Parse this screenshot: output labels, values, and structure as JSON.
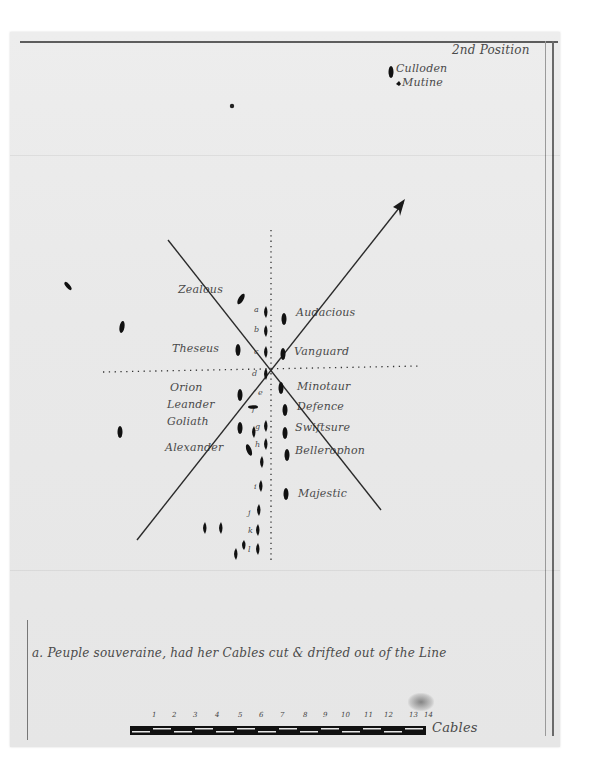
{
  "document": {
    "title": "2nd Position",
    "type": "naval battle plan manuscript"
  },
  "outlying_ships": [
    {
      "label": "Culloden"
    },
    {
      "label": "Mutine"
    }
  ],
  "port_column_labels": [
    {
      "label": "Zealous"
    },
    {
      "label": "Theseus"
    },
    {
      "label": "Orion"
    },
    {
      "label": "Leander"
    },
    {
      "label": "Goliath"
    },
    {
      "label": "Alexander"
    }
  ],
  "starboard_column_labels": [
    {
      "label": "Audacious"
    },
    {
      "label": "Vanguard"
    },
    {
      "label": "Minotaur"
    },
    {
      "label": "Defence"
    },
    {
      "label": "Swiftsure"
    },
    {
      "label": "Bellerophon"
    },
    {
      "label": "Majestic"
    }
  ],
  "enemy_line_letters": [
    "a",
    "b",
    "c",
    "d",
    "e",
    "f",
    "g",
    "h",
    "i",
    "j",
    "k",
    "l"
  ],
  "footnote": "a. Peuple souveraine, had her Cables cut & drifted out of the Line",
  "scale": {
    "ticks": [
      "1",
      "2",
      "3",
      "4",
      "5",
      "6",
      "7",
      "8",
      "9",
      "10",
      "11",
      "12",
      "13",
      "14"
    ],
    "unit": "Cables"
  },
  "colors": {
    "paper": "#e9e9e9",
    "ink": "#1a1a1a",
    "faded_ink": "#4a4a4a",
    "border": "#5d5d5d"
  }
}
